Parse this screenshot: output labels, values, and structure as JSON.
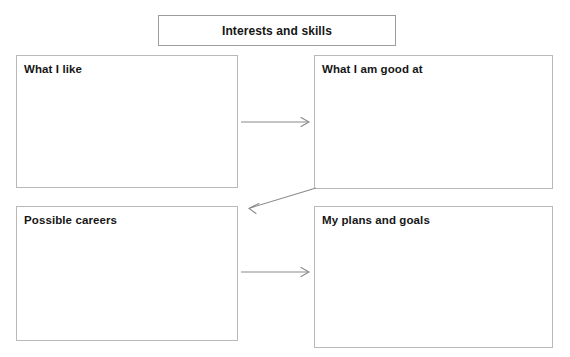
{
  "page": {
    "title": "Interests and skills",
    "background_color": "#ffffff",
    "box_border_color": "#b9b9b9",
    "arrow_color": "#8a8a8a",
    "text_color": "#161616"
  },
  "title_box": {
    "label": "Interests and skills"
  },
  "boxes": [
    {
      "id": "what-i-like",
      "label": "What I like",
      "content": ""
    },
    {
      "id": "what-i-am-good-at",
      "label": "What I am good at",
      "content": ""
    },
    {
      "id": "possible-careers",
      "label": "Possible careers",
      "content": ""
    },
    {
      "id": "my-plans-and-goals",
      "label": "My plans and goals",
      "content": ""
    }
  ],
  "arrows": [
    {
      "id": "arrow-top",
      "from": "what-i-like",
      "to": "what-i-am-good-at",
      "direction": "right"
    },
    {
      "id": "arrow-diagonal",
      "from": "what-i-am-good-at",
      "to": "possible-careers",
      "direction": "down-left"
    },
    {
      "id": "arrow-bottom",
      "from": "possible-careers",
      "to": "my-plans-and-goals",
      "direction": "right"
    }
  ]
}
